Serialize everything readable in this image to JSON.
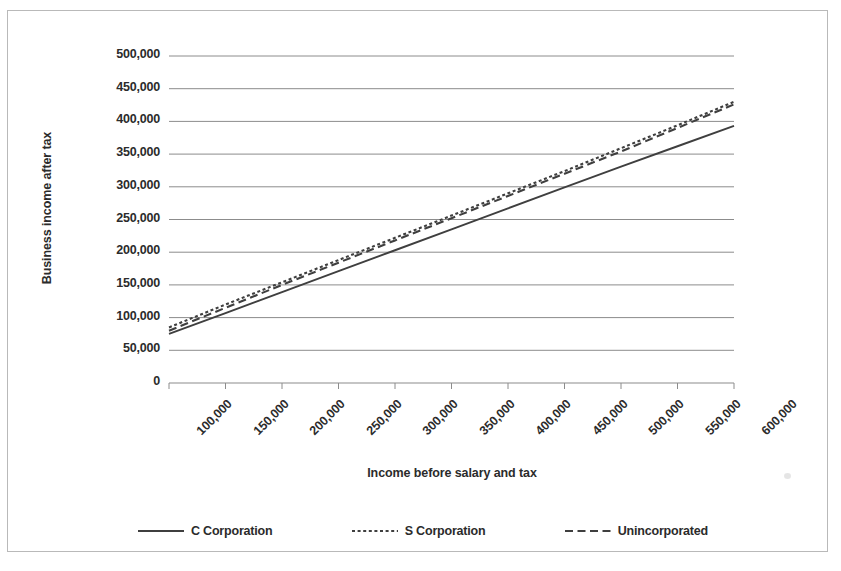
{
  "chart_data": {
    "type": "line",
    "title": "",
    "xlabel": "Income before salary and tax",
    "ylabel": "Business income after tax",
    "xlim": [
      100000,
      600000
    ],
    "ylim": [
      0,
      500000
    ],
    "grid": true,
    "legend_position": "bottom",
    "x_ticks": [
      "100,000",
      "150,000",
      "200,000",
      "250,000",
      "300,000",
      "350,000",
      "400,000",
      "450,000",
      "500,000",
      "550,000",
      "600,000"
    ],
    "y_ticks": [
      "0",
      "50,000",
      "100,000",
      "150,000",
      "200,000",
      "250,000",
      "300,000",
      "350,000",
      "400,000",
      "450,000",
      "500,000"
    ],
    "x": [
      100000,
      150000,
      200000,
      250000,
      300000,
      350000,
      400000,
      450000,
      500000,
      550000,
      600000
    ],
    "series": [
      {
        "name": "C Corporation",
        "style": "solid",
        "color": "#3f3f3f",
        "values": [
          75000,
          107000,
          139000,
          171000,
          203000,
          235000,
          267000,
          299000,
          331000,
          362000,
          393000
        ]
      },
      {
        "name": "S Corporation",
        "style": "dotted",
        "color": "#3f3f3f",
        "values": [
          85000,
          120000,
          154000,
          188000,
          222000,
          256000,
          290000,
          324000,
          359000,
          394000,
          430000
        ]
      },
      {
        "name": "Unincorporated",
        "style": "dashed",
        "color": "#3f3f3f",
        "values": [
          80000,
          115000,
          150000,
          184000,
          218000,
          252000,
          286000,
          320000,
          354000,
          390000,
          426000
        ]
      }
    ]
  },
  "axes": {
    "y_title": "Business income after tax",
    "x_title": "Income before salary and tax"
  },
  "legend": {
    "entries": [
      {
        "label": "C Corporation",
        "style": "solid"
      },
      {
        "label": "S Corporation",
        "style": "dotted"
      },
      {
        "label": "Unincorporated",
        "style": "dashed"
      }
    ]
  },
  "colors": {
    "line": "#3f3f3f",
    "grid": "#8c8c8c",
    "border": "#b9b9b9",
    "text": "#2b2b2b"
  }
}
